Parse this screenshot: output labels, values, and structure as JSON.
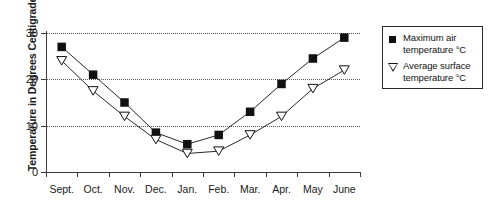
{
  "chart_data": {
    "type": "line",
    "title": "",
    "xlabel": "",
    "ylabel": "Temperarure in Degrees Centigrade",
    "categories": [
      "Sept.",
      "Oct.",
      "Nov.",
      "Dec.",
      "Jan.",
      "Feb.",
      "Mar.",
      "Apr.",
      "May",
      "June"
    ],
    "ylim": [
      0,
      30
    ],
    "yticks": [
      0,
      10,
      20,
      30
    ],
    "ytick_labels": [
      "0",
      "10",
      "20",
      "30"
    ],
    "grid": true,
    "legend_position": "right",
    "series": [
      {
        "name": "Maximum air temperature °C",
        "marker": "filled-square",
        "color": "#111111",
        "values": [
          27,
          21,
          15,
          8.5,
          6,
          8,
          13,
          19,
          24.5,
          29
        ]
      },
      {
        "name": "Average surface temperature °C",
        "marker": "open-triangle-down",
        "color": "#111111",
        "values": [
          24,
          17.5,
          12,
          7,
          4,
          4.5,
          8,
          12,
          18,
          22
        ]
      }
    ]
  },
  "legend": {
    "items": [
      {
        "label_line1": "Maximum air",
        "label_line2": "temperature °C",
        "marker": "filled-square"
      },
      {
        "label_line1": "Average surface",
        "label_line2": "temperature °C",
        "marker": "open-triangle-down"
      }
    ]
  }
}
